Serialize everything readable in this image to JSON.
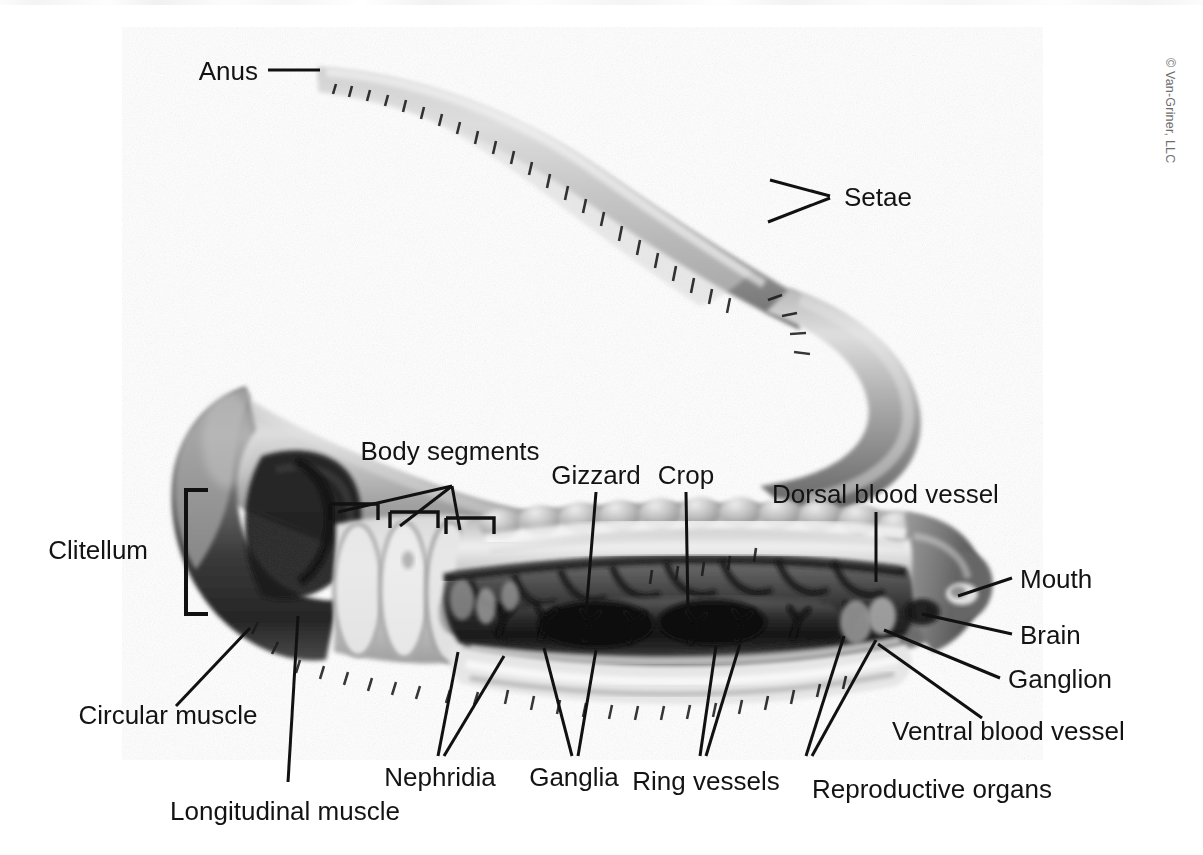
{
  "figure": {
    "caption_credit": "© Van-Griner, LLC",
    "background_color": "#ffffff",
    "label_color": "#131313",
    "leader_color": "#111111"
  },
  "labels": {
    "anus": "Anus",
    "setae": "Setae",
    "body_segments": "Body segments",
    "gizzard": "Gizzard",
    "crop": "Crop",
    "dorsal_blood_vessel": "Dorsal blood vessel",
    "mouth": "Mouth",
    "brain": "Brain",
    "ganglion": "Ganglion",
    "ventral_blood_vessel": "Ventral blood vessel",
    "reproductive_organs": "Reproductive organs",
    "ring_vessels": "Ring vessels",
    "ganglia": "Ganglia",
    "nephridia": "Nephridia",
    "longitudinal_muscle": "Longitudinal muscle",
    "circular_muscle": "Circular muscle",
    "clitellum": "Clitellum"
  }
}
